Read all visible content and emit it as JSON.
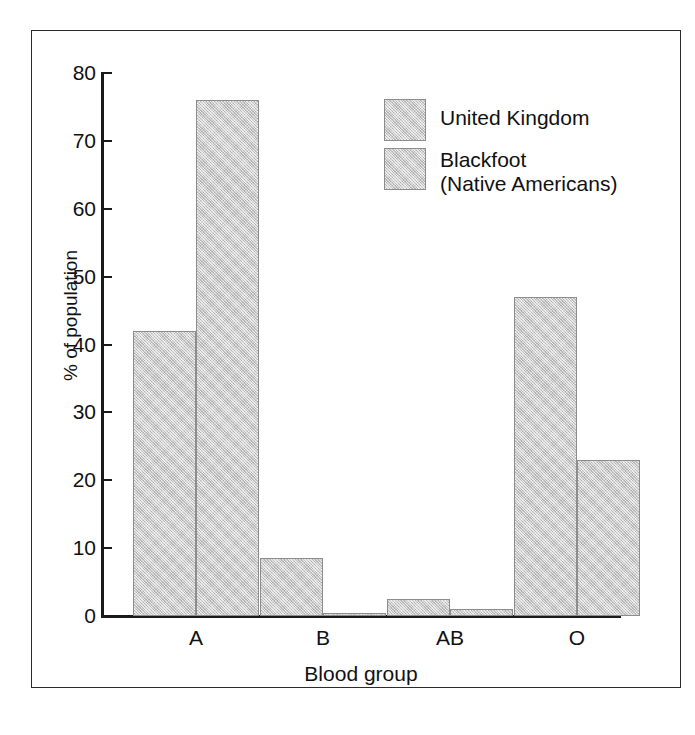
{
  "chart_data": {
    "type": "bar",
    "title": "",
    "subtitle": "",
    "xlabel": "Blood group",
    "ylabel": "% of population",
    "categories": [
      "A",
      "B",
      "AB",
      "O"
    ],
    "series": [
      {
        "name": "United Kingdom",
        "values": [
          42,
          8.5,
          2.5,
          47
        ]
      },
      {
        "name": "Blackfoot (Native Americans)",
        "values": [
          76,
          0.4,
          1.1,
          23
        ]
      }
    ],
    "ylim": [
      0,
      80
    ],
    "ytick_step": 10,
    "yticks": [
      80,
      70,
      60,
      50,
      40,
      30,
      20,
      10,
      0
    ],
    "ytick_labels": [
      "80",
      "70",
      "60",
      "50",
      "40",
      "30",
      "20",
      "10",
      "0"
    ],
    "xlim_note": "categorical",
    "grid": false,
    "legend_position": "upper-right-inside",
    "bar_fill_color": "#c9c9c9",
    "bar_border_color": "#8d8d8d",
    "axis_color": "#1a1a1a",
    "background_color": "#ffffff",
    "frame_color": "#2b2b2b"
  },
  "legend": {
    "entries": [
      {
        "label": "United Kingdom"
      },
      {
        "label": "Blackfoot\n(Native Americans)"
      }
    ]
  },
  "axes": {
    "y_title": "% of population",
    "x_title": "Blood group"
  }
}
